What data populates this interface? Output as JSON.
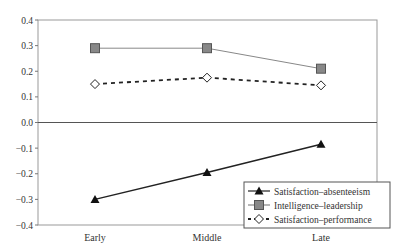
{
  "chart_data": {
    "type": "line",
    "title": "",
    "xlabel": "",
    "ylabel": "",
    "categories": [
      "Early",
      "Middle",
      "Late"
    ],
    "ylim": [
      -0.4,
      0.4
    ],
    "yticks": [
      "0.4",
      "0.3",
      "0.2",
      "0.1",
      "0.0",
      "−0.1",
      "−0.2",
      "−0.3",
      "−0.4"
    ],
    "ytick_values": [
      0.4,
      0.3,
      0.2,
      0.1,
      0.0,
      -0.1,
      -0.2,
      -0.3,
      -0.4
    ],
    "grid": false,
    "legend_position": "lower right, inside plot",
    "series": [
      {
        "name": "Satisfaction–absenteeism",
        "marker": "triangle",
        "line": "solid",
        "color": "#222222",
        "values": [
          -0.3,
          -0.195,
          -0.085
        ]
      },
      {
        "name": "Intelligence–leadership",
        "marker": "square",
        "line": "solid",
        "color": "#888888",
        "values": [
          0.29,
          0.29,
          0.21
        ]
      },
      {
        "name": "Satisfaction–performance",
        "marker": "diamond-open",
        "line": "dashed",
        "color": "#222222",
        "values": [
          0.15,
          0.175,
          0.145
        ]
      }
    ]
  }
}
